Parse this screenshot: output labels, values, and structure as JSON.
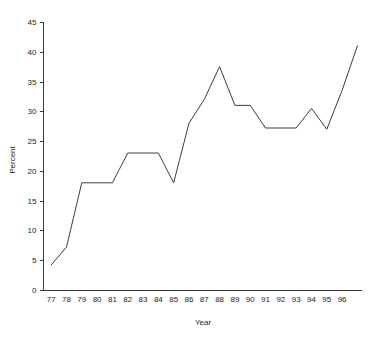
{
  "chart_data": {
    "type": "line",
    "title": "",
    "xlabel": "Year",
    "ylabel": "Percent",
    "xlim": [
      76.5,
      97.3
    ],
    "ylim": [
      0,
      45
    ],
    "grid": false,
    "legend": false,
    "x_tick_labels": [
      "77",
      "78",
      "79",
      "80",
      "81",
      "82",
      "83",
      "84",
      "85",
      "86",
      "87",
      "88",
      "89",
      "90",
      "91",
      "92",
      "93",
      "94",
      "95",
      "96"
    ],
    "y_tick_labels": [
      "0",
      "5",
      "10",
      "15",
      "20",
      "25",
      "30",
      "35",
      "40",
      "45"
    ],
    "y_ticks": [
      0,
      5,
      10,
      15,
      20,
      25,
      30,
      35,
      40,
      45
    ],
    "categories": [
      "77",
      "78",
      "79",
      "80",
      "81",
      "82",
      "83",
      "84",
      "85",
      "86",
      "87",
      "88",
      "89",
      "90",
      "91",
      "92",
      "93",
      "94",
      "95",
      "96",
      "97"
    ],
    "x": [
      77,
      78,
      79,
      80,
      81,
      82,
      83,
      84,
      85,
      86,
      87,
      88,
      89,
      90,
      91,
      92,
      93,
      94,
      95,
      96,
      97
    ],
    "series": [
      {
        "name": "Percent",
        "color": "#3c3c3c",
        "values": [
          4.2,
          7.2,
          18.0,
          18.0,
          18.0,
          23.0,
          23.0,
          23.0,
          18.0,
          28.0,
          32.0,
          37.5,
          31.0,
          31.0,
          27.2,
          27.2,
          27.2,
          30.5,
          27.0,
          33.5,
          41.0
        ]
      }
    ]
  },
  "axes": {
    "y_axis_label": "Percent",
    "x_axis_label": "Year"
  }
}
